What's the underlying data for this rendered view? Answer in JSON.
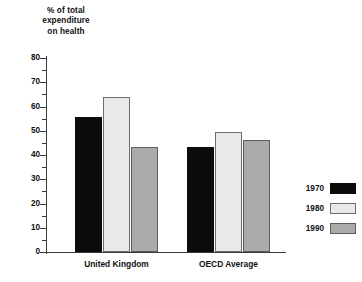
{
  "chart_data": {
    "type": "bar",
    "title": "% of total expenditure on health",
    "title_lines": [
      "% of total",
      "expenditure",
      "on health"
    ],
    "xlabel": "",
    "ylabel": "% of total expenditure on health",
    "ylim": [
      0,
      80
    ],
    "ytick_step": 10,
    "yminor_step": 5,
    "grid": false,
    "legend_position": "right",
    "categories": [
      "United Kingdom",
      "OECD Average"
    ],
    "ytick_labels": [
      "0",
      "10",
      "20",
      "30",
      "40",
      "50",
      "60",
      "70",
      "80"
    ],
    "series": [
      {
        "name": "1970",
        "color": "#0c0c0c",
        "values": [
          55.5,
          43.5
        ]
      },
      {
        "name": "1980",
        "color": "#e9e9e9",
        "values": [
          64.0,
          49.5
        ]
      },
      {
        "name": "1990",
        "color": "#ababab",
        "values": [
          43.5,
          46.0
        ]
      }
    ]
  }
}
